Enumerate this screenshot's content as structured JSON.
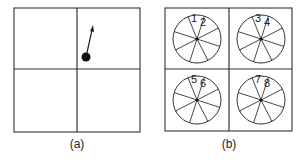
{
  "panels": [
    {
      "id": "a",
      "caption": "(a)",
      "description": "2x2 grid with a dot and arrow pointing upward in the top-right cell"
    },
    {
      "id": "b",
      "caption": "(b)",
      "description": "2x2 grid, each cell containing a circle divided into 8 sectors, two top sectors numbered",
      "cells": [
        {
          "labels": [
            "1",
            "2"
          ]
        },
        {
          "labels": [
            "3",
            "4"
          ]
        },
        {
          "labels": [
            "5",
            "6"
          ]
        },
        {
          "labels": [
            "7",
            "8"
          ]
        }
      ]
    }
  ],
  "colors": {
    "stroke": "#333333",
    "background": "#ffffff"
  }
}
